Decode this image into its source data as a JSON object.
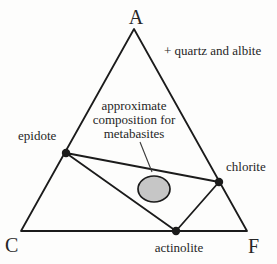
{
  "diagram": {
    "type": "ternary-ACF-phase-diagram",
    "vertices": {
      "top": "A",
      "bottom_left": "C",
      "bottom_right": "F"
    },
    "condition_note": "+ quartz and albite",
    "annotation": {
      "lines": [
        "approximate",
        "composition for",
        "metabasites"
      ]
    },
    "mineral_labels": {
      "epidote": "epidote",
      "chlorite": "chlorite",
      "actinolite": "actinolite"
    }
  },
  "colors": {
    "line": "#1b1b1b",
    "text": "#262626",
    "ellipse_fill": "#c6c6c6",
    "background": "#fdfdfc"
  },
  "geometry": {
    "triangle_path": "M134,29 L21,231 L247,231 Z",
    "tie_lines_path": "M66,153 L219,182 L176,231 Z",
    "leader_path": "M140,142 L152,172",
    "epidote_dot": {
      "cx": "66",
      "cy": "153",
      "r": "4.2"
    },
    "chlorite_dot": {
      "cx": "219",
      "cy": "182",
      "r": "4.2"
    },
    "actinolite_dot": {
      "cx": "176",
      "cy": "231",
      "r": "4.2"
    },
    "ellipse": {
      "cx": "154",
      "cy": "189",
      "rx": "16",
      "ry": "13"
    }
  }
}
